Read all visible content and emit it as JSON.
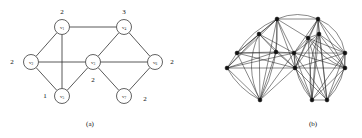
{
  "figure": {
    "panels": [
      {
        "id": "a",
        "caption": "(a)",
        "caption_x": 90,
        "caption_y": 124,
        "description": "weighted undirected graph with seven vertices",
        "nodes": [
          {
            "id": "v1",
            "label": "v",
            "sub": "1",
            "x": 62,
            "y": 27,
            "r": 7.5
          },
          {
            "id": "v2",
            "label": "v",
            "sub": "2",
            "x": 31,
            "y": 62,
            "r": 7.5
          },
          {
            "id": "v3",
            "label": "v",
            "sub": "3",
            "x": 93,
            "y": 62,
            "r": 7.5
          },
          {
            "id": "v4",
            "label": "v",
            "sub": "4",
            "x": 124,
            "y": 27,
            "r": 7.5
          },
          {
            "id": "v5",
            "label": "v",
            "sub": "5",
            "x": 62,
            "y": 96,
            "r": 7.5
          },
          {
            "id": "v6",
            "label": "v",
            "sub": "6",
            "x": 155,
            "y": 62,
            "r": 7.5
          },
          {
            "id": "v7",
            "label": "v",
            "sub": "7",
            "x": 124,
            "y": 96,
            "r": 7.5
          }
        ],
        "edges": [
          {
            "from": "v1",
            "to": "v2"
          },
          {
            "from": "v1",
            "to": "v4"
          },
          {
            "from": "v1",
            "to": "v5"
          },
          {
            "from": "v2",
            "to": "v3"
          },
          {
            "from": "v2",
            "to": "v5"
          },
          {
            "from": "v3",
            "to": "v4"
          },
          {
            "from": "v3",
            "to": "v5"
          },
          {
            "from": "v3",
            "to": "v6"
          },
          {
            "from": "v3",
            "to": "v7"
          },
          {
            "from": "v4",
            "to": "v6"
          },
          {
            "from": "v6",
            "to": "v7"
          }
        ],
        "weights": [
          {
            "value": "2",
            "for": "v1",
            "x": 62,
            "y": 12
          },
          {
            "value": "3",
            "for": "v4",
            "x": 124,
            "y": 12
          },
          {
            "value": "2",
            "for": "v2",
            "x": 12,
            "y": 62
          },
          {
            "value": "2",
            "for": "v6",
            "x": 172,
            "y": 62
          },
          {
            "value": "1",
            "for": "v5",
            "x": 45,
            "y": 96
          },
          {
            "value": "2",
            "for": "v3",
            "x": 93,
            "y": 80
          },
          {
            "value": "2",
            "for": "v7",
            "x": 145,
            "y": 99
          }
        ]
      },
      {
        "id": "b",
        "caption": "(b)",
        "caption_x": 132,
        "caption_y": 124,
        "description": "dense expanded graph of clustered vertices",
        "nodes": [
          {
            "id": "b1",
            "x": 56,
            "y": 53
          },
          {
            "id": "b2",
            "x": 46,
            "y": 68
          },
          {
            "id": "b3",
            "x": 78,
            "y": 34
          },
          {
            "id": "b4",
            "x": 79,
            "y": 100
          },
          {
            "id": "b5",
            "x": 96,
            "y": 19
          },
          {
            "id": "b6",
            "x": 95,
            "y": 52
          },
          {
            "id": "b7",
            "x": 113,
            "y": 53
          },
          {
            "id": "b8",
            "x": 114,
            "y": 68
          },
          {
            "id": "b9",
            "x": 127,
            "y": 38
          },
          {
            "id": "b10",
            "x": 138,
            "y": 34
          },
          {
            "id": "b11",
            "x": 137,
            "y": 19
          },
          {
            "id": "b12",
            "x": 131,
            "y": 100
          },
          {
            "id": "b13",
            "x": 146,
            "y": 100
          },
          {
            "id": "b14",
            "x": 164,
            "y": 53
          },
          {
            "id": "b15",
            "x": 164,
            "y": 68
          }
        ],
        "edges": [
          {
            "from": "b1",
            "to": "b2"
          },
          {
            "from": "b1",
            "to": "b3"
          },
          {
            "from": "b1",
            "to": "b4"
          },
          {
            "from": "b1",
            "to": "b5"
          },
          {
            "from": "b1",
            "to": "b6"
          },
          {
            "from": "b1",
            "to": "b7"
          },
          {
            "from": "b1",
            "to": "b8"
          },
          {
            "from": "b2",
            "to": "b3"
          },
          {
            "from": "b2",
            "to": "b4"
          },
          {
            "from": "b2",
            "to": "b5"
          },
          {
            "from": "b2",
            "to": "b6"
          },
          {
            "from": "b2",
            "to": "b7"
          },
          {
            "from": "b2",
            "to": "b8"
          },
          {
            "from": "b3",
            "to": "b4"
          },
          {
            "from": "b3",
            "to": "b5"
          },
          {
            "from": "b3",
            "to": "b6"
          },
          {
            "from": "b3",
            "to": "b7"
          },
          {
            "from": "b3",
            "to": "b8"
          },
          {
            "from": "b4",
            "to": "b5"
          },
          {
            "from": "b4",
            "to": "b6"
          },
          {
            "from": "b4",
            "to": "b7"
          },
          {
            "from": "b4",
            "to": "b8"
          },
          {
            "from": "b5",
            "to": "b6"
          },
          {
            "from": "b5",
            "to": "b7"
          },
          {
            "from": "b5",
            "to": "b8"
          },
          {
            "from": "b5",
            "to": "b9"
          },
          {
            "from": "b5",
            "to": "b11"
          },
          {
            "from": "b6",
            "to": "b7"
          },
          {
            "from": "b6",
            "to": "b8"
          },
          {
            "from": "b7",
            "to": "b8"
          },
          {
            "from": "b7",
            "to": "b9"
          },
          {
            "from": "b7",
            "to": "b10"
          },
          {
            "from": "b7",
            "to": "b11"
          },
          {
            "from": "b7",
            "to": "b12"
          },
          {
            "from": "b7",
            "to": "b13"
          },
          {
            "from": "b7",
            "to": "b14"
          },
          {
            "from": "b7",
            "to": "b15"
          },
          {
            "from": "b8",
            "to": "b9"
          },
          {
            "from": "b8",
            "to": "b10"
          },
          {
            "from": "b8",
            "to": "b11"
          },
          {
            "from": "b8",
            "to": "b12"
          },
          {
            "from": "b8",
            "to": "b13"
          },
          {
            "from": "b8",
            "to": "b14"
          },
          {
            "from": "b8",
            "to": "b15"
          },
          {
            "from": "b9",
            "to": "b10"
          },
          {
            "from": "b9",
            "to": "b11"
          },
          {
            "from": "b9",
            "to": "b12"
          },
          {
            "from": "b9",
            "to": "b13"
          },
          {
            "from": "b9",
            "to": "b14"
          },
          {
            "from": "b9",
            "to": "b15"
          },
          {
            "from": "b10",
            "to": "b11"
          },
          {
            "from": "b10",
            "to": "b12"
          },
          {
            "from": "b10",
            "to": "b13"
          },
          {
            "from": "b10",
            "to": "b14"
          },
          {
            "from": "b10",
            "to": "b15"
          },
          {
            "from": "b11",
            "to": "b12"
          },
          {
            "from": "b11",
            "to": "b13"
          },
          {
            "from": "b11",
            "to": "b14"
          },
          {
            "from": "b11",
            "to": "b15"
          },
          {
            "from": "b12",
            "to": "b13"
          },
          {
            "from": "b12",
            "to": "b14"
          },
          {
            "from": "b12",
            "to": "b15"
          },
          {
            "from": "b13",
            "to": "b14"
          },
          {
            "from": "b13",
            "to": "b15"
          },
          {
            "from": "b14",
            "to": "b15"
          }
        ],
        "curved_edges": [
          {
            "from": "b3",
            "to": "b4",
            "bow": 16
          },
          {
            "from": "b5",
            "to": "b4",
            "bow": -12
          },
          {
            "from": "b1",
            "to": "b5",
            "bow": -8
          },
          {
            "from": "b2",
            "to": "b4",
            "bow": 7
          },
          {
            "from": "b5",
            "to": "b11",
            "bow": -9
          },
          {
            "from": "b11",
            "to": "b14",
            "bow": -12
          },
          {
            "from": "b14",
            "to": "b13",
            "bow": -11
          },
          {
            "from": "b7",
            "to": "b12",
            "bow": 9
          },
          {
            "from": "b9",
            "to": "b15",
            "bow": 8
          },
          {
            "from": "b10",
            "to": "b12",
            "bow": 10
          }
        ],
        "node_radius": 1.9
      }
    ]
  }
}
